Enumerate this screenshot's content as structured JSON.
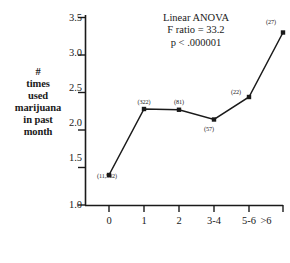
{
  "chart_data": {
    "type": "line",
    "title": "",
    "xlabel": "Number of times expelled from school",
    "ylabel_lines": [
      "#",
      "times",
      "used",
      "marijuana",
      "in past",
      "month"
    ],
    "categories": [
      "0",
      "1",
      "2",
      "3-4",
      "5-6",
      ">6"
    ],
    "values": [
      1.4,
      2.28,
      2.27,
      2.14,
      2.44,
      3.3
    ],
    "point_labels": [
      "(11,502)",
      "(322)",
      "(81)",
      "(57)",
      "(22)",
      "(27)"
    ],
    "ylim": [
      1.0,
      3.5
    ],
    "yticks": [
      "1.0",
      "1.5",
      "2.0",
      "2.5",
      "3.0",
      "3.5"
    ],
    "grid": false,
    "legend": "none",
    "marker": "square",
    "line_color": "#1a1a1a",
    "annotations": {
      "line1": "Linear ANOVA",
      "line2": "F ratio = 33.2",
      "line3": "p < .000001"
    }
  }
}
